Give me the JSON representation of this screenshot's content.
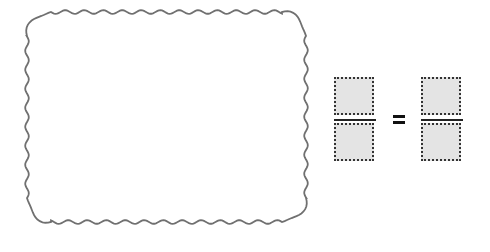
{
  "frame": {
    "shape": "wavy-rounded-rectangle",
    "border_color": "#707070",
    "fill_color": "#ffffff",
    "content": ""
  },
  "equation": {
    "left_fraction": {
      "numerator": "",
      "denominator": "",
      "box_fill": "#e4e4e4",
      "box_border": "dotted #333333"
    },
    "operator": "=",
    "right_fraction": {
      "numerator": "",
      "denominator": "",
      "box_fill": "#e4e4e4",
      "box_border": "dotted #333333"
    }
  }
}
